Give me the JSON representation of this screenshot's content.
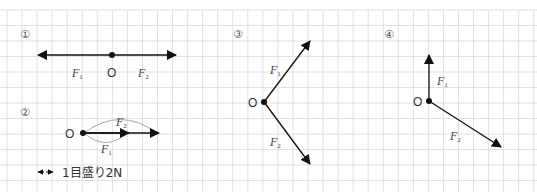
{
  "grid": {
    "unit_label": "1目盛り2N",
    "unit_newtons": 2
  },
  "figures": [
    {
      "id": "fig1",
      "number": "①",
      "origin_label": "O",
      "forces": [
        {
          "name": "F",
          "sub": "1",
          "cells": [
            -5,
            0
          ],
          "newtons": 10
        },
        {
          "name": "F",
          "sub": "2",
          "cells": [
            4,
            0
          ],
          "newtons": 8
        }
      ]
    },
    {
      "id": "fig2",
      "number": "②",
      "origin_label": "O",
      "forces": [
        {
          "name": "F",
          "sub": "1",
          "cells": [
            3,
            0
          ],
          "newtons": 6
        },
        {
          "name": "F",
          "sub": "2",
          "cells": [
            5,
            0
          ],
          "newtons": 10
        }
      ]
    },
    {
      "id": "fig3",
      "number": "③",
      "origin_label": "O",
      "forces": [
        {
          "name": "F",
          "sub": "1",
          "cells": [
            3,
            -4
          ],
          "newtons": 10
        },
        {
          "name": "F",
          "sub": "2",
          "cells": [
            3,
            4
          ],
          "newtons": 10
        }
      ]
    },
    {
      "id": "fig4",
      "number": "④",
      "origin_label": "O",
      "forces": [
        {
          "name": "F",
          "sub": "1",
          "cells": [
            0,
            -3
          ]
        },
        {
          "name": "F",
          "sub": "2",
          "cells": [
            4.7,
            3
          ]
        }
      ]
    }
  ],
  "colors": {
    "grid": "#d9d9d9",
    "arrow": "#111111",
    "arc": "#999999"
  }
}
